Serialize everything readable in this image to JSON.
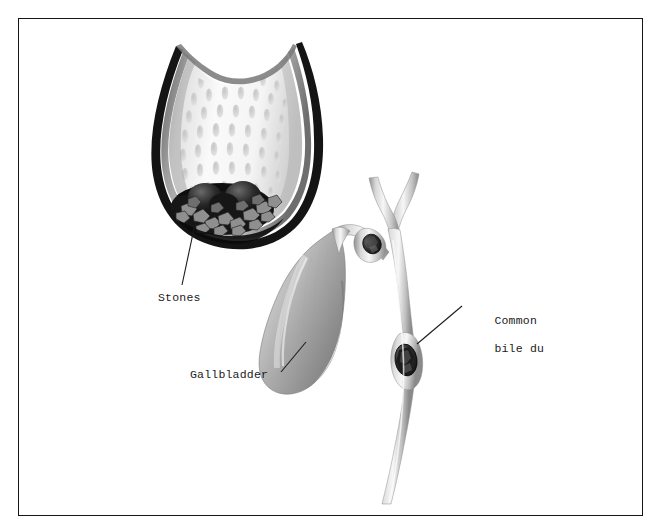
{
  "figure": {
    "title": "Gallstones in gallbladder and common bile duct",
    "type": "medical-illustration",
    "background_color": "#ffffff",
    "frame": {
      "border_color": "#161616",
      "border_width_px": 1.4,
      "inset_px": 18
    }
  },
  "labels": [
    {
      "id": "stones",
      "text": "Stones",
      "x": 158,
      "y": 291,
      "leader": {
        "x1": 195,
        "y1": 224,
        "x2": 182,
        "y2": 285
      }
    },
    {
      "id": "gallbladder",
      "text": "Gallbladder",
      "x": 190,
      "y": 368,
      "leader": {
        "x1": 306,
        "y1": 342,
        "x2": 281,
        "y2": 372
      }
    },
    {
      "id": "common_bile_duct",
      "text": "Common\nbile du",
      "line1": "Common",
      "line2": "bile du",
      "x": 466,
      "y": 300,
      "leader": {
        "x1": 417,
        "y1": 344,
        "x2": 462,
        "y2": 306
      }
    }
  ],
  "anatomy": {
    "cutaway_gallbladder": {
      "name": "Opened gallbladder cross-section",
      "wall_color": "#111111",
      "serosa_color": "#8d8d8d",
      "mucosa_color": "#f2f2f2",
      "rugae_color": "#d2d2d2",
      "rugae_count": 46
    },
    "stone_cluster": {
      "name": "Gallstone cluster",
      "stone_dark_color": "#1a1a1a",
      "facet_color": "#9a9a9a",
      "count": 22
    },
    "intact_gallbladder": {
      "name": "Intact gallbladder body",
      "fill_light": "#efefef",
      "fill_mid": "#b8b8b8",
      "fill_dark": "#8a8a8a"
    },
    "biliary_tree": {
      "name": "Biliary duct system",
      "duct_light": "#f4f4f4",
      "duct_mid": "#c8c8c8",
      "duct_shadow": "#909090",
      "branches": [
        "right hepatic duct",
        "left hepatic duct",
        "common hepatic duct",
        "cystic duct",
        "common bile duct"
      ]
    },
    "impacted_stones": [
      {
        "location": "cystic duct",
        "cx": 377,
        "cy": 243
      },
      {
        "location": "common bile duct",
        "cx": 406,
        "cy": 359
      }
    ]
  },
  "colors": {
    "ink": "#1b1b1b",
    "frame": "#161616",
    "paper": "#ffffff"
  }
}
